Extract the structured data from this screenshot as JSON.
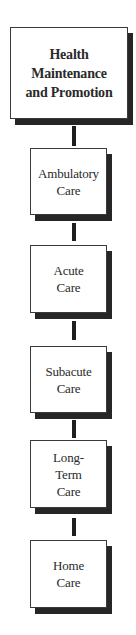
{
  "diagram": {
    "type": "vertical-flow",
    "nodes": [
      {
        "id": "health-maintenance",
        "label": "Health\nMaintenance\nand Promotion"
      },
      {
        "id": "ambulatory-care",
        "label": "Ambulatory\nCare"
      },
      {
        "id": "acute-care",
        "label": "Acute\nCare"
      },
      {
        "id": "subacute-care",
        "label": "Subacute\nCare"
      },
      {
        "id": "long-term-care",
        "label": "Long-\nTerm\nCare"
      },
      {
        "id": "home-care",
        "label": "Home\nCare"
      }
    ],
    "edges": [
      {
        "from": "health-maintenance",
        "to": "ambulatory-care"
      },
      {
        "from": "ambulatory-care",
        "to": "acute-care"
      },
      {
        "from": "acute-care",
        "to": "subacute-care"
      },
      {
        "from": "subacute-care",
        "to": "long-term-care"
      },
      {
        "from": "long-term-care",
        "to": "home-care"
      }
    ],
    "colors": {
      "box_fill": "#ffffff",
      "box_border": "#3a3a3a",
      "shadow": "#262626",
      "connector": "#1e1e1e",
      "text": "#2a2a2a"
    }
  }
}
